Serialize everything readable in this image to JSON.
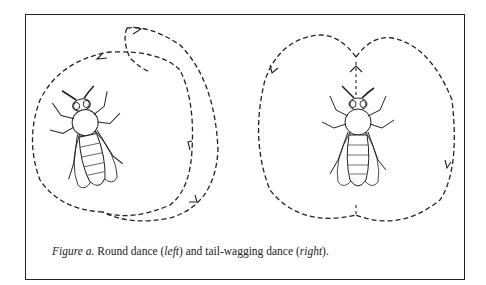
{
  "figure": {
    "caption_label": "Figure a.",
    "caption_part1": " Round dance (",
    "caption_left": "left",
    "caption_part2": ") and tail-wagging dance (",
    "caption_right": "right",
    "caption_part3": ")."
  },
  "panels": [
    {
      "name": "round-dance",
      "subject": "bee",
      "path": "circular dance path"
    },
    {
      "name": "tail-wagging-dance",
      "subject": "bee",
      "path": "figure-eight dance path with straight waggle run"
    }
  ]
}
